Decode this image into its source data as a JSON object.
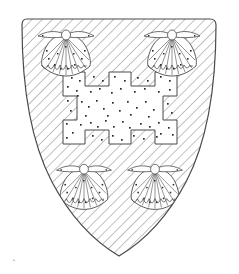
{
  "image": {
    "kind": "heraldic-illustration",
    "title": "Armorial escutcheon",
    "background_color": "#ffffff",
    "ink_color": "#3a3a3a",
    "hatch_color": "#6e6e6e",
    "spot_color": "#2b2b2b",
    "width": 239,
    "height": 274
  },
  "shield": {
    "name": "escutcheon",
    "outline_color": "#4a4a4a",
    "outline_width": 1.1,
    "geometry": {
      "left": 21,
      "right": 216,
      "top": 19,
      "point_y": 256,
      "point_x": 119,
      "top_corner_radius": 6
    },
    "field": {
      "treatment": "diagonal-hatching",
      "direction": "upper-left to lower-right",
      "line_spacing": 7.2,
      "line_width": 0.85,
      "color": "#6e6e6e",
      "label": "hatched field"
    }
  },
  "charges": {
    "cross": {
      "name": "cross-potent",
      "label": "Cross potent ermine",
      "treatment": "ermine-spotted",
      "fill": "#ffffff",
      "stroke": "#4a4a4a",
      "stroke_width": 1.0,
      "center_x": 120,
      "center_y": 120,
      "arm_half_width": 11,
      "arm_length": 45,
      "potent_half_width": 22,
      "potent_depth": 12,
      "spot_count": 62
    },
    "escallops": [
      {
        "name": "escallop-chief-dexter",
        "label": "Escallop in chief dexter",
        "cx": 66,
        "cy": 50,
        "scale": 1.0,
        "rib_count": 9,
        "spotted": true
      },
      {
        "name": "escallop-chief-sinister",
        "label": "Escallop in chief sinister",
        "cx": 172,
        "cy": 50,
        "scale": 1.0,
        "rib_count": 9,
        "spotted": true
      },
      {
        "name": "escallop-base-dexter",
        "label": "Escallop in base dexter",
        "cx": 84,
        "cy": 183,
        "scale": 0.98,
        "rib_count": 9,
        "spotted": true
      },
      {
        "name": "escallop-base-sinister",
        "label": "Escallop in base sinister",
        "cx": 155,
        "cy": 183,
        "scale": 0.98,
        "rib_count": 9,
        "spotted": true
      }
    ],
    "count_escallops": 4
  },
  "annotation": {
    "corner_mark": "•",
    "corner_mark_visible": true
  }
}
